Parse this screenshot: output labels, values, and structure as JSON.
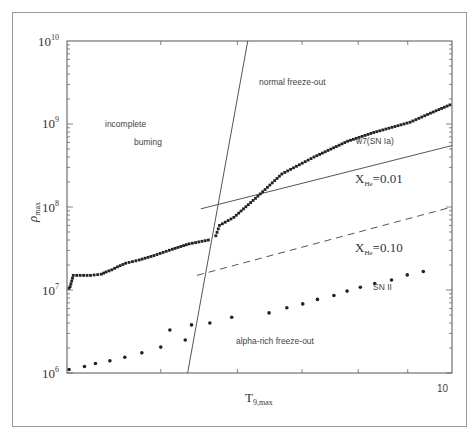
{
  "chart_data": {
    "type": "scatter",
    "title": "",
    "xlabel": "T9,max",
    "ylabel": "ρmax",
    "xscale": "log",
    "yscale": "log",
    "xlim": [
      4,
      10
    ],
    "ylim": [
      1000000,
      10000000000
    ],
    "x_tick_labels": [
      "10"
    ],
    "y_tick_labels": [
      "10^6",
      "10^7",
      "10^8",
      "10^9",
      "10^10"
    ],
    "grid": false,
    "legend": null,
    "regions": [
      {
        "label": "incomplete burning",
        "lines": [
          "incomplete",
          "burning"
        ]
      },
      {
        "label": "normal freeze-out"
      },
      {
        "label": "alpha-rich freeze-out"
      }
    ],
    "boundary_lines": [
      {
        "name": "incomplete/complete boundary",
        "style": "solid",
        "points": [
          [
            5.33,
            1000000
          ],
          [
            6.15,
            10000000000
          ]
        ]
      },
      {
        "name": "X_He=0.01",
        "label": "X_He=0.01",
        "style": "solid",
        "points": [
          [
            5.5,
            95000000
          ],
          [
            10.0,
            550000000
          ]
        ]
      },
      {
        "name": "X_He=0.10",
        "label": "X_He=0.10",
        "style": "dashed",
        "points": [
          [
            5.45,
            15000000
          ],
          [
            10.0,
            100000000
          ]
        ]
      }
    ],
    "series": [
      {
        "name": "w7(SN Ia)",
        "marker": "square",
        "x": [
          4.02,
          4.03,
          4.06,
          4.23,
          4.34,
          4.39,
          4.45,
          4.51,
          4.6,
          4.75,
          4.92,
          5.14,
          5.35,
          5.6,
          5.7,
          5.75,
          5.95,
          6.3,
          6.67,
          7.2,
          7.8,
          8.3,
          9.05,
          9.5,
          9.95
        ],
        "y": [
          10500000,
          11000000,
          15000000,
          15000000,
          15500000,
          16500000,
          17500000,
          19000000,
          21000000,
          23000000,
          26000000,
          31000000,
          36000000,
          40000000,
          45000000,
          60000000,
          75000000,
          135000000,
          250000000,
          400000000,
          620000000,
          790000000,
          1050000000,
          1350000000,
          1700000000
        ]
      },
      {
        "name": "SN II",
        "marker": "circle",
        "x": [
          4.02,
          4.17,
          4.28,
          4.43,
          4.59,
          4.78,
          5.0,
          5.11,
          5.3,
          5.38,
          5.62,
          5.92,
          6.47,
          6.75,
          7.01,
          7.26,
          7.55,
          7.79,
          8.04,
          8.32,
          8.66,
          8.99,
          9.34
        ],
        "y": [
          1100000,
          1200000,
          1300000,
          1400000,
          1550000,
          1750000,
          2050000,
          3300000,
          2500000,
          3800000,
          4000000,
          4700000,
          5300000,
          6100000,
          6800000,
          7700000,
          8600000,
          9700000,
          10800000,
          12000000,
          13200000,
          15200000,
          16700000
        ]
      }
    ],
    "annotations": [
      {
        "text": "normal freeze-out"
      },
      {
        "text": "incomplete"
      },
      {
        "text": "burning"
      },
      {
        "text": "w7(SN Ia)"
      },
      {
        "text": "X_He=0.01"
      },
      {
        "text": "X_He=0.10"
      },
      {
        "text": "SN II"
      },
      {
        "text": "alpha-rich freeze-out"
      }
    ]
  },
  "labels": {
    "xlabel_main": "T",
    "xlabel_sub": "9,max",
    "ylabel_main": "ρ",
    "ylabel_sub": "max",
    "ytick_base": "10",
    "ytick_exp": [
      "10",
      "9",
      "8",
      "7",
      "6"
    ],
    "xtick_10": "10",
    "region_incomplete": "incomplete",
    "region_burning": "buming",
    "region_normal": "normal freeze-out",
    "region_alpha": "alpha-rich freeze-out",
    "series_w7": "w7(SN Ia)",
    "series_sn2": "SN II",
    "xhe1_main": "X",
    "xhe1_sub": "He",
    "xhe1_val": "=0.01",
    "xhe2_main": "X",
    "xhe2_sub": "He",
    "xhe2_val": "=0.10"
  }
}
